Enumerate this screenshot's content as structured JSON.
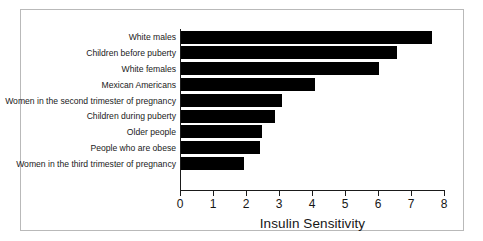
{
  "chart_data": {
    "type": "bar",
    "orientation": "horizontal",
    "title": "",
    "xlabel": "Insulin Sensitivity",
    "ylabel": "",
    "xlim": [
      0,
      8
    ],
    "xticks": [
      "0",
      "1",
      "2",
      "3",
      "4",
      "5",
      "6",
      "7",
      "8"
    ],
    "grid": false,
    "legend": null,
    "bar_color": "#000000",
    "categories": [
      "White males",
      "Children before puberty",
      "White females",
      "Mexican Americans",
      "Women in the second trimester of pregnancy",
      "Children during puberty",
      "Older people",
      "People who are obese",
      "Women in the third trimester of pregnancy"
    ],
    "values": [
      7.6,
      6.55,
      6.0,
      4.05,
      3.05,
      2.85,
      2.45,
      2.4,
      1.9
    ]
  },
  "figure": {
    "border_color": "#b9b9b9",
    "background": "#ffffff",
    "axis_color": "#1a1a1a"
  }
}
